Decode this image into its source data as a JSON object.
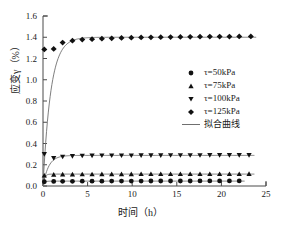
{
  "chart_data": {
    "type": "scatter",
    "title": "",
    "xlabel": "时间（h）",
    "ylabel": "应变γ（%）",
    "xlim": [
      0,
      25
    ],
    "ylim": [
      0.0,
      1.6
    ],
    "xticks": [
      "0",
      "5",
      "10",
      "15",
      "20",
      "25"
    ],
    "xtick_values": [
      0,
      5,
      10,
      15,
      20,
      25
    ],
    "yticks": [
      "0.0",
      "0.2",
      "0.4",
      "0.6",
      "0.8",
      "1.0",
      "1.2",
      "1.4",
      "1.6"
    ],
    "ytick_values": [
      0.0,
      0.2,
      0.4,
      0.6,
      0.8,
      1.0,
      1.2,
      1.4,
      1.6
    ],
    "grid": false,
    "legend_position": "center-right",
    "marker_color": "#111111",
    "fit_line_color": "#6f6f6f",
    "axis_color": "#4a4a4a",
    "series": [
      {
        "name": "τ=50kPa",
        "marker": "circle",
        "x": [
          0.15,
          1.2,
          2.2,
          3.3,
          4.4,
          5.5,
          6.6,
          7.7,
          8.8,
          9.9,
          11.0,
          12.1,
          13.2,
          14.3,
          15.4,
          16.5,
          17.6,
          18.7,
          19.8,
          20.9,
          22.0
        ],
        "y": [
          0.04,
          0.043,
          0.044,
          0.044,
          0.045,
          0.045,
          0.045,
          0.046,
          0.046,
          0.046,
          0.046,
          0.047,
          0.047,
          0.047,
          0.047,
          0.047,
          0.048,
          0.048,
          0.048,
          0.048,
          0.048
        ],
        "fit_plateau": 0.046,
        "fit_rate": 6.0
      },
      {
        "name": "τ=75kPa",
        "marker": "triangle-up",
        "x": [
          0.15,
          1.2,
          2.2,
          3.3,
          4.4,
          5.5,
          6.6,
          7.7,
          8.8,
          9.9,
          11.0,
          12.1,
          13.2,
          14.3,
          15.4,
          16.5,
          17.6,
          18.7,
          19.8,
          20.9,
          22.0,
          23.1
        ],
        "y": [
          0.1,
          0.108,
          0.11,
          0.11,
          0.111,
          0.111,
          0.112,
          0.112,
          0.112,
          0.112,
          0.113,
          0.113,
          0.113,
          0.113,
          0.113,
          0.114,
          0.114,
          0.114,
          0.114,
          0.114,
          0.114,
          0.115
        ],
        "fit_plateau": 0.112,
        "fit_rate": 6.0
      },
      {
        "name": "τ=100kPa",
        "marker": "triangle-down",
        "x": [
          0.15,
          1.2,
          2.2,
          3.3,
          4.4,
          5.5,
          6.6,
          7.7,
          8.8,
          9.9,
          11.0,
          12.1,
          13.2,
          14.3,
          15.4,
          16.5,
          17.6,
          18.7,
          19.8,
          20.9,
          22.0,
          23.1
        ],
        "y": [
          0.3,
          0.262,
          0.275,
          0.281,
          0.284,
          0.285,
          0.286,
          0.286,
          0.287,
          0.287,
          0.288,
          0.288,
          0.288,
          0.289,
          0.289,
          0.289,
          0.289,
          0.29,
          0.29,
          0.29,
          0.29,
          0.29
        ],
        "fit_plateau": 0.288,
        "fit_rate": 1.6
      },
      {
        "name": "τ=125kPa",
        "marker": "diamond",
        "x": [
          0.15,
          1.2,
          2.2,
          3.3,
          4.4,
          5.5,
          6.6,
          7.7,
          8.8,
          9.9,
          11.0,
          12.1,
          13.2,
          14.3,
          15.4,
          16.5,
          17.6,
          18.7,
          19.8,
          20.9,
          22.0,
          23.3
        ],
        "y": [
          1.285,
          1.29,
          1.35,
          1.368,
          1.378,
          1.382,
          1.386,
          1.39,
          1.393,
          1.396,
          1.398,
          1.4,
          1.401,
          1.402,
          1.403,
          1.404,
          1.405,
          1.406,
          1.406,
          1.407,
          1.408,
          1.408
        ],
        "fit_plateau": 1.4,
        "fit_rate": 1.15
      }
    ],
    "fit_curve_label": "拟合曲线"
  },
  "legend": {
    "items": [
      {
        "label": "τ=50kPa",
        "marker": "circle"
      },
      {
        "label": "τ=75kPa",
        "marker": "triangle-up"
      },
      {
        "label": "τ=100kPa",
        "marker": "triangle-down"
      },
      {
        "label": "τ=125kPa",
        "marker": "diamond"
      },
      {
        "label": "拟合曲线",
        "marker": "line"
      }
    ]
  },
  "axes": {
    "xlabel": "时间（h）",
    "ylabel": "应变γ（%）",
    "xticks": [
      "0",
      "5",
      "10",
      "15",
      "20",
      "25"
    ],
    "yticks": [
      "0.0",
      "0.2",
      "0.4",
      "0.6",
      "0.8",
      "1.0",
      "1.2",
      "1.4",
      "1.6"
    ]
  }
}
